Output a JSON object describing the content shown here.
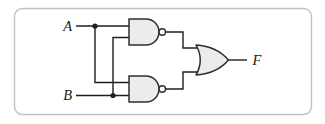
{
  "figure": {
    "type": "logic-circuit-diagram",
    "labels": {
      "input_a": "A",
      "input_b": "B",
      "output_f": "F"
    },
    "gates": [
      {
        "id": "nand-top",
        "type": "NAND",
        "inputs": [
          "A",
          "B"
        ],
        "feeds": "or-gate"
      },
      {
        "id": "nand-bottom",
        "type": "NAND",
        "inputs": [
          "A",
          "B"
        ],
        "feeds": "or-gate"
      },
      {
        "id": "or-gate",
        "type": "OR",
        "inputs": [
          "nand-top",
          "nand-bottom"
        ],
        "output": "F"
      }
    ],
    "colors": {
      "background": "#ffffff",
      "frame_border": "#c2c2c2",
      "gate_fill": "#ececec",
      "gate_stroke": "#2e2e2e",
      "wire": "#1f1f1f",
      "label_text": "#1a1a1a"
    }
  }
}
